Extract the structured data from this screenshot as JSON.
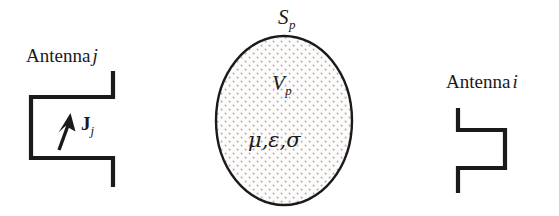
{
  "figure": {
    "background_color": "#ffffff",
    "stroke_color": "#1a1a1a",
    "stipple_color": "#b9b2ac"
  },
  "antenna_left": {
    "label_text": "Antenna",
    "label_index": "j",
    "current_symbol": "J",
    "current_subscript": "j",
    "arrow_icon": "current-arrow-icon"
  },
  "antenna_right": {
    "label_text": "Antenna",
    "label_index": "i"
  },
  "scatterer": {
    "surface_symbol": "S",
    "surface_subscript": "p",
    "volume_symbol": "V",
    "volume_subscript": "p",
    "material_params": "μ,ε,σ"
  }
}
